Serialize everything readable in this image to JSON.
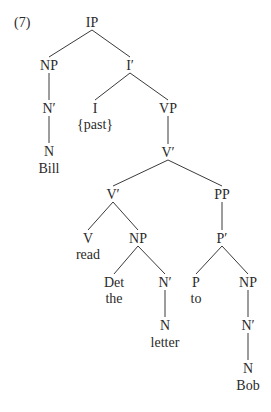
{
  "example_number": "(7)",
  "nodes": [
    {
      "id": "IP",
      "label": "IP",
      "x": 92,
      "y": 22
    },
    {
      "id": "NP1",
      "label": "NP",
      "x": 49,
      "y": 65
    },
    {
      "id": "Ibar",
      "label": "I′",
      "x": 130,
      "y": 65
    },
    {
      "id": "Nbar1",
      "label": "N′",
      "x": 49,
      "y": 108
    },
    {
      "id": "I",
      "label": "I",
      "x": 95,
      "y": 108
    },
    {
      "id": "VP",
      "label": "VP",
      "x": 168,
      "y": 108
    },
    {
      "id": "N1",
      "label": "N",
      "x": 49,
      "y": 151
    },
    {
      "id": "Vbar1",
      "label": "V′",
      "x": 168,
      "y": 152
    },
    {
      "id": "Vbar2",
      "label": "V′",
      "x": 113,
      "y": 194
    },
    {
      "id": "PP",
      "label": "PP",
      "x": 222,
      "y": 194
    },
    {
      "id": "V",
      "label": "V",
      "x": 88,
      "y": 238
    },
    {
      "id": "NP2",
      "label": "NP",
      "x": 138,
      "y": 238
    },
    {
      "id": "Pbar",
      "label": "P′",
      "x": 222,
      "y": 238
    },
    {
      "id": "Det",
      "label": "Det",
      "x": 114,
      "y": 282
    },
    {
      "id": "Nbar2",
      "label": "N′",
      "x": 165,
      "y": 282
    },
    {
      "id": "P",
      "label": "P",
      "x": 196,
      "y": 282
    },
    {
      "id": "NP3",
      "label": "NP",
      "x": 248,
      "y": 282
    },
    {
      "id": "N2",
      "label": "N",
      "x": 165,
      "y": 325
    },
    {
      "id": "Nbar3",
      "label": "N′",
      "x": 248,
      "y": 325
    },
    {
      "id": "N3",
      "label": "N",
      "x": 248,
      "y": 368
    }
  ],
  "words": [
    {
      "id": "w_past",
      "text": "{past}",
      "x": 95,
      "y": 124
    },
    {
      "id": "w_bill",
      "text": "Bill",
      "x": 49,
      "y": 168
    },
    {
      "id": "w_read",
      "text": "read",
      "x": 88,
      "y": 254
    },
    {
      "id": "w_the",
      "text": "the",
      "x": 114,
      "y": 298
    },
    {
      "id": "w_to",
      "text": "to",
      "x": 196,
      "y": 298
    },
    {
      "id": "w_letter",
      "text": "letter",
      "x": 165,
      "y": 342
    },
    {
      "id": "w_bob",
      "text": "Bob",
      "x": 248,
      "y": 385
    }
  ],
  "edges": [
    [
      "IP",
      "NP1"
    ],
    [
      "IP",
      "Ibar"
    ],
    [
      "NP1",
      "Nbar1"
    ],
    [
      "Nbar1",
      "N1"
    ],
    [
      "Ibar",
      "I"
    ],
    [
      "Ibar",
      "VP"
    ],
    [
      "VP",
      "Vbar1"
    ],
    [
      "Vbar1",
      "Vbar2"
    ],
    [
      "Vbar1",
      "PP"
    ],
    [
      "Vbar2",
      "V"
    ],
    [
      "Vbar2",
      "NP2"
    ],
    [
      "NP2",
      "Det"
    ],
    [
      "NP2",
      "Nbar2"
    ],
    [
      "Nbar2",
      "N2"
    ],
    [
      "PP",
      "Pbar"
    ],
    [
      "Pbar",
      "P"
    ],
    [
      "Pbar",
      "NP3"
    ],
    [
      "NP3",
      "Nbar3"
    ],
    [
      "Nbar3",
      "N3"
    ]
  ],
  "colors": {
    "text": "#2a2a2a",
    "line": "#3a3a3a",
    "background": "#ffffff"
  }
}
